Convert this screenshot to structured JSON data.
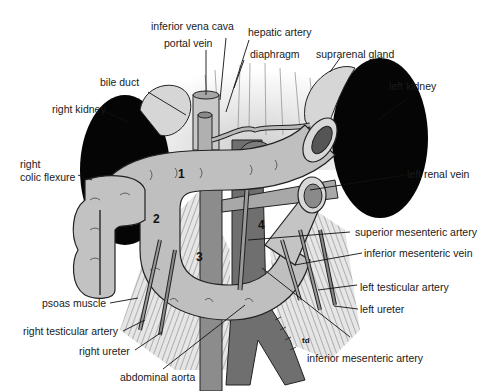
{
  "figure": {
    "signature": "td",
    "colors": {
      "background": "#ffffff",
      "kidney": "#050505",
      "duodenum": "#bdbdbd",
      "vessel_dark": "#7a7a7a",
      "muscle_hatch": "#555555",
      "text": "#1a1a1a"
    },
    "duodenum_parts": [
      "1",
      "2",
      "3",
      "4"
    ],
    "labels": {
      "inferior_vena_cava": "inferior vena cava",
      "hepatic_artery": "hepatic artery",
      "portal_vein": "portal vein",
      "diaphragm": "diaphragm",
      "suprarenal_gland": "suprarenal gland",
      "bile_duct": "bile duct",
      "left_kidney": "left kidney",
      "right_kidney": "right kidney",
      "right_colic_flexure_1": "right",
      "right_colic_flexure_2": "colic flexure",
      "left_renal_vein": "left renal vein",
      "superior_mesenteric_artery": "superior mesenteric artery",
      "inferior_mesenteric_vein": "inferior mesenteric vein",
      "left_testicular_artery": "left testicular artery",
      "left_ureter": "left ureter",
      "psoas_muscle": "psoas muscle",
      "right_testicular_artery": "right testicular artery",
      "right_ureter": "right ureter",
      "abdominal_aorta": "abdominal aorta",
      "inferior_mesenteric_artery": "inferior mesenteric artery"
    }
  }
}
